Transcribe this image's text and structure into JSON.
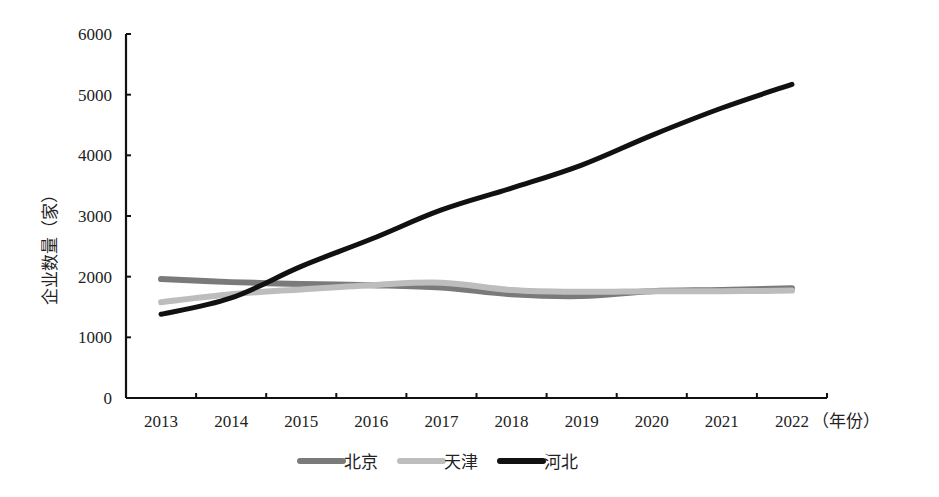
{
  "chart_data": {
    "type": "line",
    "title": "",
    "xlabel": "（年份）",
    "ylabel": "企业数量（家）",
    "categories": [
      "2013",
      "2014",
      "2015",
      "2016",
      "2017",
      "2018",
      "2019",
      "2020",
      "2021",
      "2022"
    ],
    "series": [
      {
        "name": "北京",
        "color": "#7a7a7a",
        "values": [
          1960,
          1910,
          1880,
          1860,
          1820,
          1710,
          1680,
          1760,
          1780,
          1810
        ]
      },
      {
        "name": "天津",
        "color": "#bdbdbd",
        "values": [
          1580,
          1710,
          1790,
          1860,
          1900,
          1780,
          1750,
          1760,
          1760,
          1770
        ]
      },
      {
        "name": "河北",
        "color": "#111111",
        "values": [
          1380,
          1650,
          2170,
          2620,
          3100,
          3460,
          3840,
          4330,
          4780,
          5170
        ]
      }
    ],
    "yticks": [
      0,
      1000,
      2000,
      3000,
      4000,
      5000,
      6000
    ],
    "ylim": [
      0,
      6000
    ],
    "grid": false,
    "legend_position": "bottom"
  }
}
